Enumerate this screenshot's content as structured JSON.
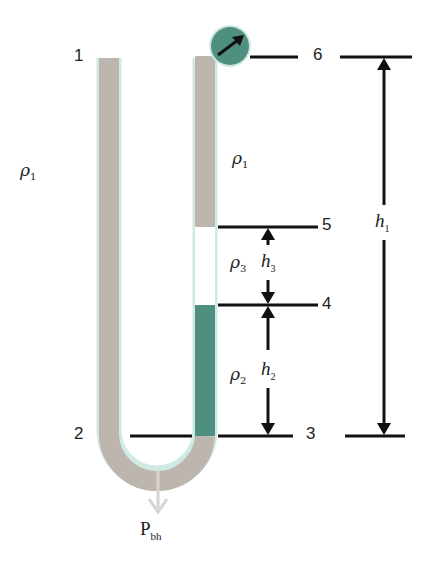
{
  "diagram": {
    "type": "U-tube manometer / wellbore pressure diagram",
    "colors": {
      "fluid1": "#bdb6ae",
      "fluid2": "#4e8f7f",
      "fluid3": "#ffffff",
      "tube_outline": "#cfe9e3",
      "gauge": "#4e8f7f",
      "lines": "#111111",
      "pbh_arrow": "#d9d4cf"
    },
    "points": [
      {
        "id": "1",
        "label": "1"
      },
      {
        "id": "2",
        "label": "2"
      },
      {
        "id": "3",
        "label": "3"
      },
      {
        "id": "4",
        "label": "4"
      },
      {
        "id": "5",
        "label": "5"
      },
      {
        "id": "6",
        "label": "6"
      }
    ],
    "densities": {
      "rho1_left": {
        "symbol": "ρ",
        "sub": "1"
      },
      "rho1_right": {
        "symbol": "ρ",
        "sub": "1"
      },
      "rho3": {
        "symbol": "ρ",
        "sub": "3"
      },
      "rho2": {
        "symbol": "ρ",
        "sub": "2"
      }
    },
    "heights": {
      "h1": {
        "symbol": "h",
        "sub": "1"
      },
      "h2": {
        "symbol": "h",
        "sub": "2"
      },
      "h3": {
        "symbol": "h",
        "sub": "3"
      }
    },
    "bottomhole": {
      "symbol": "P",
      "sub": "bh"
    },
    "gauge": {
      "name": "pressure gauge"
    }
  }
}
